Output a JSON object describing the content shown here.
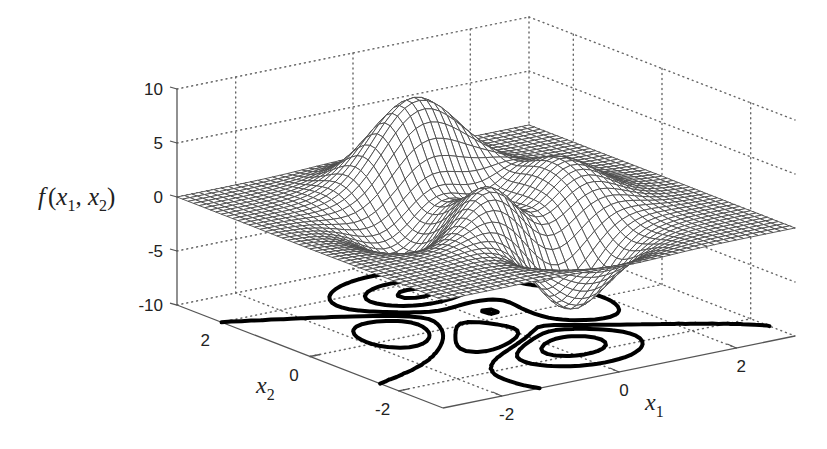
{
  "chart_data": {
    "type": "surface-mesh-with-contour",
    "title": "",
    "function": "peaks",
    "formula": "3(1-x1)^2 exp(-x1^2-(x2+1)^2) - 10(x1/5 - x1^3 - x2^5) exp(-x1^2-x2^2) - 1/3 exp(-(x1+1)^2-x2^2)",
    "domain": {
      "x1": [
        -3,
        3
      ],
      "x2": [
        -3,
        3
      ]
    },
    "mesh_resolution": 49,
    "zlabel": "f (x1, x2)",
    "xlabel": "x1",
    "ylabel": "x2",
    "zlim": [
      -10,
      10
    ],
    "xlim": [
      -3,
      3
    ],
    "ylim": [
      -3,
      3
    ],
    "zticks": [
      10,
      5,
      0,
      -5,
      -10
    ],
    "zticklabels": [
      "10",
      "5",
      "0",
      "-5",
      "-10"
    ],
    "xticks": [
      -2,
      0,
      2
    ],
    "xticklabels": [
      "-2",
      "0",
      "2"
    ],
    "yticks": [
      2,
      0,
      -2
    ],
    "yticklabels": [
      "2",
      "0",
      "-2"
    ],
    "grid": true,
    "contour_levels": [
      -4.5,
      -1.5,
      0.0,
      1.5,
      4.5,
      7.5
    ],
    "features": {
      "max_peak": {
        "x1": 0.0,
        "x2": 1.58,
        "z": 8.1
      },
      "min_valley": {
        "x1": 0.23,
        "x2": -1.63,
        "z": -6.55
      },
      "secondary_peak": {
        "x1": -0.46,
        "x2": -0.63,
        "z": 3.78
      },
      "secondary_valley": {
        "x1": -1.35,
        "x2": 0.2,
        "z": -3.05
      }
    },
    "colors": {
      "mesh": "#4a4a4a",
      "contour": "#000000",
      "grid": "#666666",
      "axis": "#555555"
    }
  },
  "labels": {
    "z_axis": {
      "f": "f",
      "open": "(",
      "x1": "x",
      "sub1": "1",
      "comma": ", ",
      "x2": "x",
      "sub2": "2",
      "close": ")"
    },
    "x_axis": {
      "main": "x",
      "sub": "1"
    },
    "y_axis": {
      "main": "x",
      "sub": "2"
    }
  }
}
